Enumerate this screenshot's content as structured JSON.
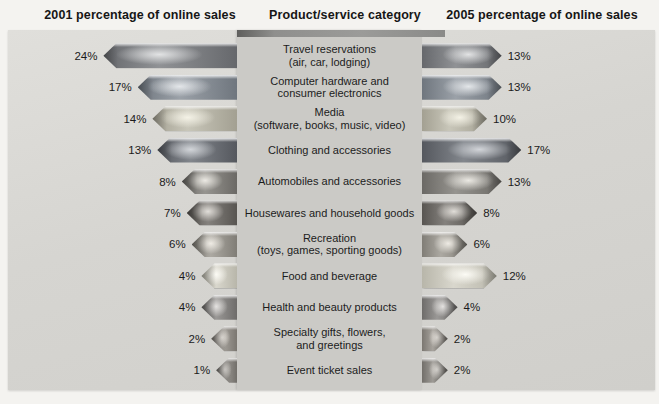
{
  "headers": {
    "left": "2001 percentage of online sales",
    "center": "Product/service category",
    "right": "2005 percentage of online sales"
  },
  "chart_data": {
    "type": "bar",
    "variant": "bidirectional-horizontal-arrows",
    "unit": "percent",
    "categories": [
      "Travel reservations\n(air, car, lodging)",
      "Computer hardware and\nconsumer electronics",
      "Media\n(software, books, music, video)",
      "Clothing and accessories",
      "Automobiles and accessories",
      "Housewares and household goods",
      "Recreation\n(toys, games, sporting goods)",
      "Food and beverage",
      "Health and beauty products",
      "Specialty gifts, flowers,\nand greetings",
      "Event ticket sales"
    ],
    "series": [
      {
        "name": "2001 percentage of online sales",
        "side": "left",
        "values": [
          24,
          17,
          14,
          13,
          8,
          7,
          6,
          4,
          4,
          2,
          1
        ],
        "labels": [
          "24%",
          "17%",
          "14%",
          "13%",
          "8%",
          "7%",
          "6%",
          "4%",
          "4%",
          "2%",
          "1%"
        ]
      },
      {
        "name": "2005 percentage of online sales",
        "side": "right",
        "values": [
          13,
          13,
          10,
          17,
          13,
          8,
          6,
          12,
          4,
          2,
          2
        ],
        "labels": [
          "13%",
          "13%",
          "10%",
          "17%",
          "13%",
          "8%",
          "6%",
          "12%",
          "4%",
          "2%",
          "2%"
        ]
      }
    ],
    "row_colors": [
      {
        "base": "#909295",
        "dark": "#66686c",
        "light": "#e2e3e4"
      },
      {
        "base": "#9ba1a8",
        "dark": "#6f767e",
        "light": "#e3e6e9"
      },
      {
        "base": "#c8c6b9",
        "dark": "#a3a092",
        "light": "#f4f2e6"
      },
      {
        "base": "#82868c",
        "dark": "#55585e",
        "light": "#d2d5d9"
      },
      {
        "base": "#96948f",
        "dark": "#6b6965",
        "light": "#ebe9e3"
      },
      {
        "base": "#84817d",
        "dark": "#585551",
        "light": "#e0ddd8"
      },
      {
        "base": "#aca9a2",
        "dark": "#807d76",
        "light": "#eeebe4"
      },
      {
        "base": "#d9d7cd",
        "dark": "#b8b6aa",
        "light": "#fcfbf5"
      },
      {
        "base": "#9a9896",
        "dark": "#6e6c6a",
        "light": "#e4e2e0"
      },
      {
        "base": "#a7a39d",
        "dark": "#7b7771",
        "light": "#ebe7e1"
      },
      {
        "base": "#9e9b96",
        "dark": "#726f6a",
        "light": "#e6e3de"
      }
    ],
    "layout": {
      "panel_background": "#d6d5d1",
      "category_box_background": "#cbcac6",
      "category_box_top_edge": "#8f8f8d",
      "legend": "none",
      "grid": "off"
    }
  }
}
